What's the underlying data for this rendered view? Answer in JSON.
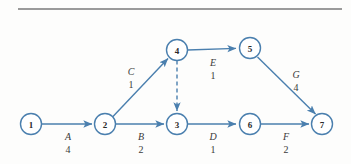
{
  "figure": {
    "type": "activity-on-arrow-network-diagram",
    "divider_color": "#9a9a9a",
    "node_stroke_color": "#4a7fae",
    "edge_color": "#4a7fae",
    "label_color": "#3a3a3a",
    "background_color": "#fdfdfc"
  },
  "nodes": [
    {
      "id": "1",
      "label": "1",
      "x": 31,
      "y": 124
    },
    {
      "id": "2",
      "label": "2",
      "x": 105,
      "y": 124
    },
    {
      "id": "3",
      "label": "3",
      "x": 177,
      "y": 124
    },
    {
      "id": "4",
      "label": "4",
      "x": 177,
      "y": 50
    },
    {
      "id": "5",
      "label": "5",
      "x": 250,
      "y": 48
    },
    {
      "id": "6",
      "label": "6",
      "x": 250,
      "y": 124
    },
    {
      "id": "7",
      "label": "7",
      "x": 322,
      "y": 124
    }
  ],
  "edges": [
    {
      "id": "A",
      "from": "1",
      "to": "2",
      "letter": "A",
      "weight": "4",
      "style": "solid",
      "label_x": 68,
      "letter_y": 140,
      "weight_y": 153
    },
    {
      "id": "B",
      "from": "2",
      "to": "3",
      "letter": "B",
      "weight": "2",
      "style": "solid",
      "label_x": 141,
      "letter_y": 140,
      "weight_y": 153
    },
    {
      "id": "C",
      "from": "2",
      "to": "4",
      "letter": "C",
      "weight": "1",
      "style": "solid",
      "label_x": 131,
      "letter_y": 75,
      "weight_y": 88
    },
    {
      "id": "D",
      "from": "3",
      "to": "6",
      "letter": "D",
      "weight": "1",
      "style": "solid",
      "label_x": 213,
      "letter_y": 140,
      "weight_y": 153
    },
    {
      "id": "E",
      "from": "4",
      "to": "5",
      "letter": "E",
      "weight": "1",
      "style": "solid",
      "label_x": 213,
      "letter_y": 66,
      "weight_y": 79
    },
    {
      "id": "F",
      "from": "6",
      "to": "7",
      "letter": "F",
      "weight": "2",
      "style": "solid",
      "label_x": 286,
      "letter_y": 140,
      "weight_y": 153
    },
    {
      "id": "G",
      "from": "5",
      "to": "7",
      "letter": "G",
      "weight": "4",
      "style": "solid",
      "label_x": 296,
      "letter_y": 78,
      "weight_y": 91
    },
    {
      "id": "dummy",
      "from": "4",
      "to": "3",
      "letter": "",
      "weight": "",
      "style": "dashed",
      "label_x": 0,
      "letter_y": 0,
      "weight_y": 0
    }
  ]
}
